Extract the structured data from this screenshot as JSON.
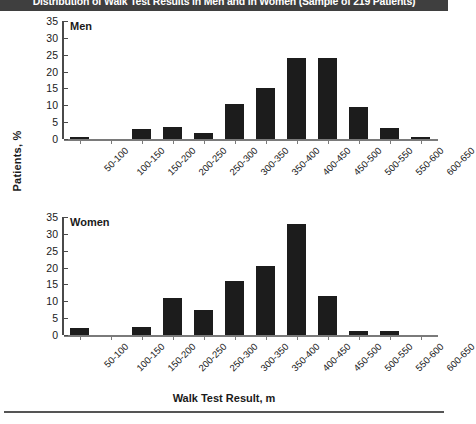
{
  "figure": {
    "title": "Distribution of Walk Test Results in Men and in Women (Sample of 219 Patients)",
    "ylabel": "Patients, %",
    "xlabel": "Walk Test Result, m",
    "bar_color": "#1c1c1c",
    "axis_color": "#4a4a4a",
    "title_bg": "#3f3f3f",
    "title_fg": "#ffffff"
  },
  "panels": [
    {
      "label": "Men"
    },
    {
      "label": "Women"
    }
  ],
  "yticks": [
    "0",
    "5",
    "10",
    "15",
    "20",
    "25",
    "30",
    "35"
  ],
  "chart_data": [
    {
      "type": "bar",
      "title": "Men",
      "categories": [
        "50-100",
        "100-150",
        "150-200",
        "200-250",
        "250-300",
        "300-350",
        "350-400",
        "400-450",
        "450-500",
        "500-550",
        "550-600",
        "600-650"
      ],
      "values": [
        0.5,
        0,
        3,
        3.5,
        1.8,
        10.5,
        15,
        24,
        24,
        9.5,
        3.3,
        0.5
      ],
      "xlabel": "Walk Test Result, m",
      "ylabel": "Patients, %",
      "ylim": [
        0,
        35
      ],
      "yticks": [
        0,
        5,
        10,
        15,
        20,
        25,
        30,
        35
      ],
      "grid": false,
      "legend": "none"
    },
    {
      "type": "bar",
      "title": "Women",
      "categories": [
        "50-100",
        "100-150",
        "150-200",
        "200-250",
        "250-300",
        "300-350",
        "350-400",
        "400-450",
        "450-500",
        "500-550",
        "550-600",
        "600-650"
      ],
      "values": [
        2.0,
        0,
        2.5,
        11.0,
        7.5,
        16.0,
        20.5,
        33.0,
        11.5,
        1.2,
        1.2,
        0
      ],
      "xlabel": "Walk Test Result, m",
      "ylabel": "Patients, %",
      "ylim": [
        0,
        35
      ],
      "yticks": [
        0,
        5,
        10,
        15,
        20,
        25,
        30,
        35
      ],
      "grid": false,
      "legend": "none"
    }
  ]
}
